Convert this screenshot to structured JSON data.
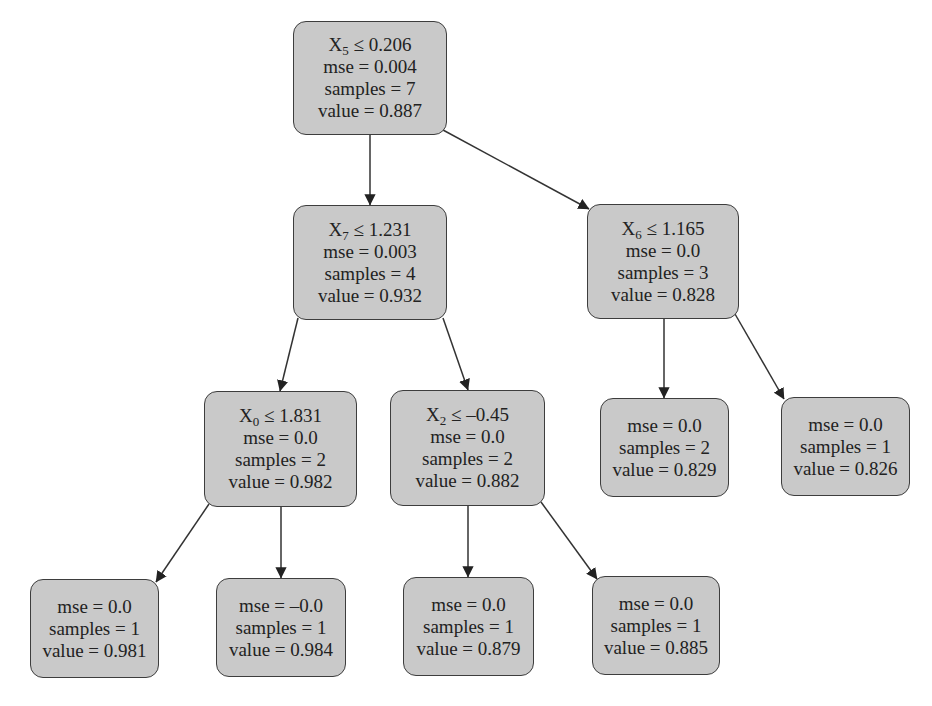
{
  "colors": {
    "node_fill": "#c9c9c9",
    "node_border": "#3d3d3d",
    "edge": "#333333",
    "text": "#222222"
  },
  "nodes": [
    {
      "id": "n0",
      "feature": "X",
      "feature_index": "5",
      "op": "≤",
      "threshold": "0.206",
      "mse": "mse = 0.004",
      "samples": "samples = 7",
      "value": "value = 0.887",
      "box": [
        293,
        21,
        154,
        114
      ]
    },
    {
      "id": "n1",
      "feature": "X",
      "feature_index": "7",
      "op": "≤",
      "threshold": "1.231",
      "mse": "mse = 0.003",
      "samples": "samples = 4",
      "value": "value = 0.932",
      "box": [
        293,
        205,
        154,
        115
      ]
    },
    {
      "id": "n2",
      "feature": "X",
      "feature_index": "6",
      "op": "≤",
      "threshold": "1.165",
      "mse": "mse = 0.0",
      "samples": "samples = 3",
      "value": "value = 0.828",
      "box": [
        587,
        204,
        152,
        115
      ]
    },
    {
      "id": "n3",
      "feature": "X",
      "feature_index": "0",
      "op": "≤",
      "threshold": "1.831",
      "mse": "mse = 0.0",
      "samples": "samples = 2",
      "value": "value = 0.982",
      "box": [
        204,
        391,
        153,
        116
      ]
    },
    {
      "id": "n4",
      "feature": "X",
      "feature_index": "2",
      "op": "≤",
      "threshold": "–0.45",
      "mse": "mse = 0.0",
      "samples": "samples = 2",
      "value": "value = 0.882",
      "box": [
        390,
        390,
        155,
        116
      ]
    },
    {
      "id": "n5",
      "mse": "mse = 0.0",
      "samples": "samples = 2",
      "value": "value = 0.829",
      "box": [
        600,
        398,
        129,
        99
      ]
    },
    {
      "id": "n6",
      "mse": "mse = 0.0",
      "samples": "samples = 1",
      "value": "value = 0.826",
      "box": [
        781,
        397,
        129,
        99
      ]
    },
    {
      "id": "n7",
      "mse": "mse = 0.0",
      "samples": "samples = 1",
      "value": "value = 0.981",
      "box": [
        30,
        579,
        129,
        99
      ]
    },
    {
      "id": "n8",
      "mse": "mse = –0.0",
      "samples": "samples = 1",
      "value": "value = 0.984",
      "box": [
        216,
        578,
        130,
        99
      ]
    },
    {
      "id": "n9",
      "mse": "mse = 0.0",
      "samples": "samples = 1",
      "value": "value = 0.879",
      "box": [
        403,
        577,
        131,
        99
      ]
    },
    {
      "id": "n10",
      "mse": "mse = 0.0",
      "samples": "samples = 1",
      "value": "value = 0.885",
      "box": [
        592,
        576,
        128,
        99
      ]
    }
  ],
  "edges": [
    {
      "from": "n0",
      "to": "n1",
      "path": [
        370,
        135,
        370,
        205
      ]
    },
    {
      "from": "n0",
      "to": "n2",
      "path": [
        443,
        130,
        589,
        209
      ]
    },
    {
      "from": "n1",
      "to": "n3",
      "path": [
        298,
        318,
        280,
        391
      ]
    },
    {
      "from": "n1",
      "to": "n4",
      "path": [
        443,
        318,
        468,
        390
      ]
    },
    {
      "from": "n2",
      "to": "n5",
      "path": [
        664,
        319,
        664,
        398
      ]
    },
    {
      "from": "n2",
      "to": "n6",
      "path": [
        735,
        314,
        784,
        399
      ]
    },
    {
      "from": "n3",
      "to": "n7",
      "path": [
        209,
        504,
        156,
        582
      ]
    },
    {
      "from": "n3",
      "to": "n8",
      "path": [
        281,
        507,
        281,
        578
      ]
    },
    {
      "from": "n4",
      "to": "n9",
      "path": [
        468,
        506,
        468,
        577
      ]
    },
    {
      "from": "n4",
      "to": "n10",
      "path": [
        541,
        502,
        597,
        579
      ]
    }
  ]
}
